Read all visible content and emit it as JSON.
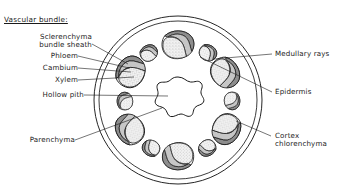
{
  "figure": {
    "type": "biological-cross-section-diagram",
    "background_color": "#ffffff",
    "ink_color": "#1a1a1a"
  },
  "group_heading": {
    "text": "Vascular bundle:",
    "underlined": true
  },
  "labels_left": [
    {
      "id": "sclerenchyma-bundle-sheath",
      "line1": "Sclerenchyma",
      "line2": "bundle sheath"
    },
    {
      "id": "phloem",
      "line1": "Phloem",
      "line2": ""
    },
    {
      "id": "cambium",
      "line1": "Cambium",
      "line2": ""
    },
    {
      "id": "xylem",
      "line1": "Xylem",
      "line2": ""
    },
    {
      "id": "hollow-pith",
      "line1": "Hollow pith",
      "line2": ""
    },
    {
      "id": "parenchyma",
      "line1": "Parenchyma",
      "line2": ""
    }
  ],
  "labels_right": [
    {
      "id": "medullary-rays",
      "line1": "Medullary rays",
      "line2": ""
    },
    {
      "id": "epidermis",
      "line1": "Epidermis",
      "line2": ""
    },
    {
      "id": "cortex-chlorenchyma",
      "line1": "Cortex",
      "line2": "chlorenchyma"
    }
  ],
  "structures": {
    "epidermis_outer_circle": {
      "cx": 178,
      "cy": 100,
      "r": 84
    },
    "epidermis_inner_circle": {
      "cx": 178,
      "cy": 100,
      "r": 79
    },
    "hollow_pith": {
      "cx": 178,
      "cy": 99,
      "lobes": 7,
      "outer_r": 22,
      "inner_r": 15
    },
    "large_bundles_count": 6,
    "small_bundles_count": 6,
    "bundle_ring_radius_large": 55,
    "bundle_ring_radius_small": 50
  },
  "tissue_colors": {
    "sclerenchyma_sheath": "#8a8a8a",
    "phloem": "#c9c9c9",
    "cambium": "#ffffff",
    "xylem_stipple": "#d8d8d8",
    "outline": "#1a1a1a"
  }
}
